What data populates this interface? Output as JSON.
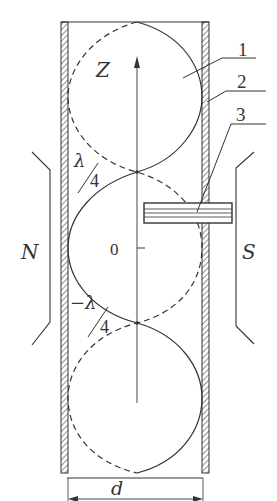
{
  "diagram": {
    "type": "standing-wave-in-waveguide",
    "axis_label": "Z",
    "origin_label": "0",
    "upper_node_label": {
      "num": "λ",
      "den": "4"
    },
    "lower_node_label": {
      "num": "−λ",
      "den": "4"
    },
    "pole_left": "N",
    "pole_right": "S",
    "width_label": "d",
    "callouts": [
      "1",
      "2",
      "3"
    ]
  },
  "colors": {
    "line": "#333333",
    "hatch": "#555555",
    "background": "#ffffff"
  }
}
